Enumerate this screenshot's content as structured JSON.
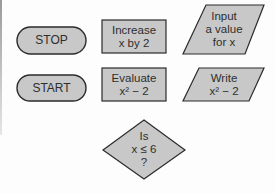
{
  "diagram": {
    "type": "flowchart-symbols",
    "colors": {
      "fill": "#c8c8c8",
      "stroke": "#2b2b2b",
      "text": "#2e2e2e",
      "background": "#fdfdfd"
    },
    "shapes": [
      {
        "id": "stop",
        "kind": "terminator",
        "lines": [
          "STOP"
        ]
      },
      {
        "id": "increase",
        "kind": "process",
        "lines": [
          "Increase",
          "x by 2"
        ]
      },
      {
        "id": "input",
        "kind": "input-output",
        "lines": [
          "Input",
          "a value",
          "for x"
        ]
      },
      {
        "id": "start",
        "kind": "terminator",
        "lines": [
          "START"
        ]
      },
      {
        "id": "evaluate",
        "kind": "process",
        "lines": [
          "Evaluate",
          "x² − 2"
        ]
      },
      {
        "id": "write",
        "kind": "input-output",
        "lines": [
          "Write",
          "x² − 2"
        ]
      },
      {
        "id": "decision",
        "kind": "decision",
        "lines": [
          "Is",
          "x ≤ 6",
          "?"
        ]
      }
    ]
  }
}
